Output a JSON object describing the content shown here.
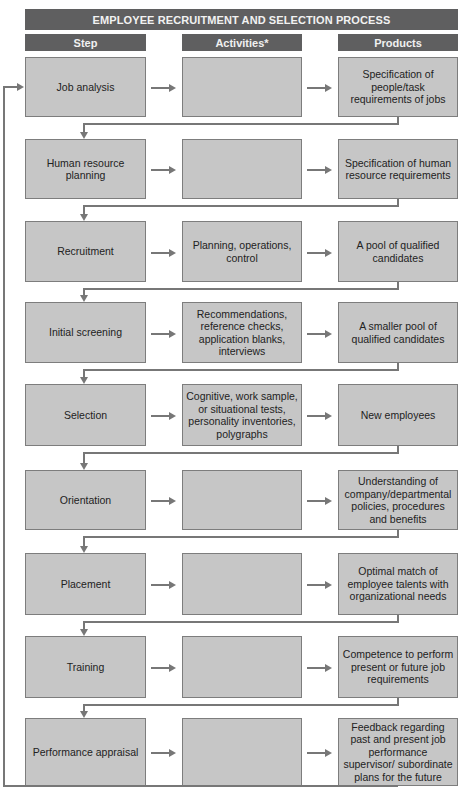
{
  "title": "EMPLOYEE RECRUITMENT AND SELECTION PROCESS",
  "headers": {
    "step": "Step",
    "activities": "Activities*",
    "products": "Products"
  },
  "colors": {
    "header_bg": "#5f5f60",
    "box_bg": "#c6c6c6",
    "connector": "#777777"
  },
  "rows": [
    {
      "step": "Job analysis",
      "activities": "",
      "products": "Specification of people/task requirements of jobs"
    },
    {
      "step": "Human resource planning",
      "activities": "",
      "products": "Specification of human resource requirements"
    },
    {
      "step": "Recruitment",
      "activities": "Planning, operations, control",
      "products": "A pool of qualified candidates"
    },
    {
      "step": "Initial screening",
      "activities": "Recommendations, reference checks, application blanks, interviews",
      "products": "A smaller pool of qualified candidates"
    },
    {
      "step": "Selection",
      "activities": "Cognitive, work sample, or situational tests, personality inventories, polygraphs",
      "products": "New employees"
    },
    {
      "step": "Orientation",
      "activities": "",
      "products": "Understanding of company/departmental policies, procedures and benefits"
    },
    {
      "step": "Placement",
      "activities": "",
      "products": "Optimal match of employee talents with organizational needs"
    },
    {
      "step": "Training",
      "activities": "",
      "products": "Competence to perform present or future job requirements"
    },
    {
      "step": "Performance appraisal",
      "activities": "",
      "products": "Feedback regarding past and present job performance supervisor/ subordinate plans for the future"
    }
  ]
}
